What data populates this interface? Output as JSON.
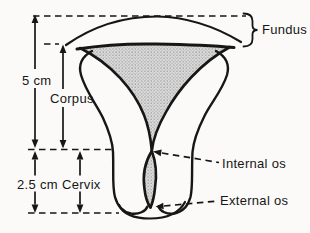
{
  "figure": {
    "labels": {
      "fundus": "Fundus",
      "corpus": "Corpus",
      "cervix": "Cervix",
      "internal_os": "Internal os",
      "external_os": "External os"
    },
    "measurements": {
      "corpus_length": "5 cm",
      "cervix_length": "2.5 cm"
    },
    "colors": {
      "background": "#fbfaf8",
      "line": "#161616",
      "stipple_base": "#dcdcdc",
      "stipple_dot": "#8f8f8f"
    }
  }
}
